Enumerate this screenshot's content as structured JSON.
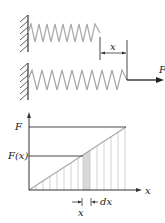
{
  "figure": {
    "top_labels": {
      "displacement": "x",
      "force": "F"
    },
    "graph_labels": {
      "y_max": "F",
      "y_mid": "F(x)",
      "x_axis": "x",
      "x_pos": "x",
      "dx": "dx"
    }
  },
  "colors": {
    "line": "#333333",
    "spring": "#a8a8a8",
    "shade": "#d9d9d9",
    "grid": "#c8c8c8"
  }
}
